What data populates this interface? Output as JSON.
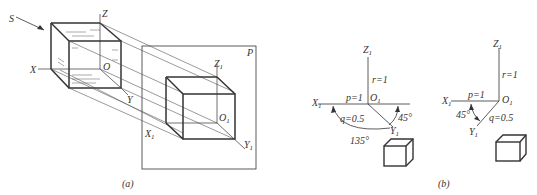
{
  "figure_a": {
    "caption": "(a)",
    "plane_label": "P",
    "projection_direction_label": "S",
    "axes_3d": {
      "x": "X",
      "y": "Y",
      "z": "Z",
      "origin": "O"
    },
    "axes_projected": {
      "x": "X",
      "x_sub": "1",
      "y": "Y",
      "y_sub": "1",
      "z": "Z",
      "z_sub": "1",
      "origin": "O",
      "origin_sub": "1"
    }
  },
  "figure_b": {
    "caption": "(b)",
    "left": {
      "x_axis": "X",
      "y_axis": "Y",
      "z_axis": "Z",
      "origin": "O",
      "sub": "1",
      "p": "p=1",
      "q": "q=0.5",
      "r": "r=1",
      "angle_1": "45°",
      "angle_2": "135°"
    },
    "right": {
      "x_axis": "X",
      "y_axis": "Y",
      "z_axis": "Z",
      "origin": "O",
      "sub": "1",
      "p": "p=1",
      "q": "q=0.5",
      "r": "r=1",
      "angle_1": "45°"
    }
  },
  "colors": {
    "line": "#333333",
    "thin": "#555555"
  }
}
